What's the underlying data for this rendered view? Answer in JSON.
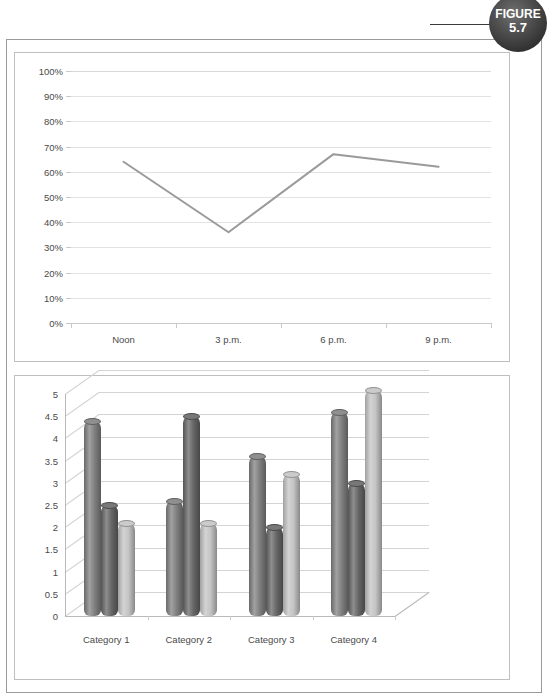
{
  "figure_badge": {
    "label": "FIGURE",
    "number": "5.7"
  },
  "line_chart": {
    "name": "line-chart",
    "chart_data": {
      "type": "line",
      "title": "",
      "xlabel": "",
      "ylabel": "",
      "categories": [
        "Noon",
        "3 p.m.",
        "6 p.m.",
        "9 p.m."
      ],
      "values": [
        64,
        36,
        67,
        62
      ],
      "ylim": [
        0,
        100
      ],
      "yticks": [
        "0%",
        "10%",
        "20%",
        "30%",
        "40%",
        "50%",
        "60%",
        "70%",
        "80%",
        "90%",
        "100%"
      ],
      "ytick_values": [
        0,
        10,
        20,
        30,
        40,
        50,
        60,
        70,
        80,
        90,
        100
      ],
      "grid": true,
      "legend": "none",
      "series_color": "#9a9a9a"
    }
  },
  "bar_chart": {
    "name": "bar-chart-3d",
    "chart_data": {
      "type": "bar",
      "title": "",
      "xlabel": "",
      "ylabel": "",
      "categories": [
        "Category 1",
        "Category 2",
        "Category 3",
        "Category 4"
      ],
      "series": [
        {
          "name": "Series 1",
          "values": [
            4.4,
            2.6,
            3.6,
            4.6
          ],
          "color": "#808080"
        },
        {
          "name": "Series 2",
          "values": [
            2.5,
            4.5,
            2.0,
            3.0
          ],
          "color": "#666666"
        },
        {
          "name": "Series 3",
          "values": [
            2.1,
            2.1,
            3.2,
            5.1
          ],
          "color": "#c4c4c4"
        }
      ],
      "ylim": [
        0,
        5
      ],
      "yticks": [
        "0",
        "0.5",
        "1",
        "1.5",
        "2",
        "2.5",
        "3",
        "3.5",
        "4",
        "4.5",
        "5"
      ],
      "ytick_values": [
        0,
        0.5,
        1,
        1.5,
        2,
        2.5,
        3,
        3.5,
        4,
        4.5,
        5
      ],
      "grid": true,
      "legend": "right",
      "legend_entries": [
        "Series 1",
        "Series 2",
        "Series 3"
      ]
    }
  }
}
